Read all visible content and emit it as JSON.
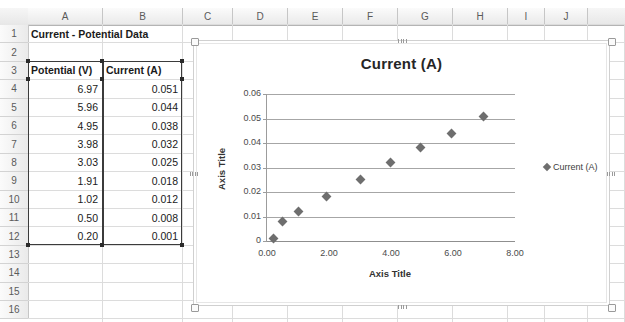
{
  "spreadsheet": {
    "column_headers": [
      "A",
      "B",
      "C",
      "D",
      "E",
      "F",
      "G",
      "H",
      "I",
      "J"
    ],
    "row_headers": [
      "1",
      "2",
      "3",
      "4",
      "5",
      "6",
      "7",
      "8",
      "9",
      "10",
      "11",
      "12",
      "13",
      "14",
      "15",
      "16"
    ],
    "title_cell": "Current - Potential Data",
    "table_headers": [
      "Potential (V)",
      "Current (A)"
    ],
    "rows": [
      {
        "potential": "6.97",
        "current": "0.051"
      },
      {
        "potential": "5.96",
        "current": "0.044"
      },
      {
        "potential": "4.95",
        "current": "0.038"
      },
      {
        "potential": "3.98",
        "current": "0.032"
      },
      {
        "potential": "3.03",
        "current": "0.025"
      },
      {
        "potential": "1.91",
        "current": "0.018"
      },
      {
        "potential": "1.02",
        "current": "0.012"
      },
      {
        "potential": "0.50",
        "current": "0.008"
      },
      {
        "potential": "0.20",
        "current": "0.001"
      }
    ],
    "selection_range": "A3:B12"
  },
  "chart_data": {
    "type": "scatter",
    "title": "Current (A)",
    "xlabel": "Axis Title",
    "ylabel": "Axis Title",
    "legend": [
      "Current (A)"
    ],
    "legend_position": "right",
    "grid": true,
    "xlim": [
      0,
      8
    ],
    "ylim": [
      0,
      0.06
    ],
    "xticks": [
      "0.00",
      "2.00",
      "4.00",
      "6.00",
      "8.00"
    ],
    "xtick_values": [
      0,
      2,
      4,
      6,
      8
    ],
    "yticks": [
      "0",
      "0.01",
      "0.02",
      "0.03",
      "0.04",
      "0.05",
      "0.06"
    ],
    "ytick_values": [
      0,
      0.01,
      0.02,
      0.03,
      0.04,
      0.05,
      0.06
    ],
    "series": [
      {
        "name": "Current (A)",
        "marker": "diamond",
        "color": "#6e6e6e",
        "points": [
          {
            "x": 0.2,
            "y": 0.001
          },
          {
            "x": 0.5,
            "y": 0.008
          },
          {
            "x": 1.02,
            "y": 0.012
          },
          {
            "x": 1.91,
            "y": 0.018
          },
          {
            "x": 3.03,
            "y": 0.025
          },
          {
            "x": 3.98,
            "y": 0.032
          },
          {
            "x": 4.95,
            "y": 0.038
          },
          {
            "x": 5.96,
            "y": 0.044
          },
          {
            "x": 6.97,
            "y": 0.051
          }
        ]
      }
    ]
  }
}
